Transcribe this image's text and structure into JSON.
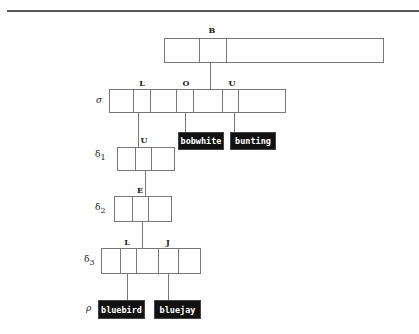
{
  "diagram": {
    "type": "trie",
    "root": {
      "edge_label": "B"
    },
    "rows": {
      "sigma": {
        "label": "σ",
        "edge_labels": [
          "L",
          "O",
          "U"
        ]
      },
      "delta1": {
        "label": "δ",
        "sub": "1",
        "edge_labels": [
          "U"
        ]
      },
      "delta2": {
        "label": "δ",
        "sub": "2",
        "edge_labels": [
          "E"
        ]
      },
      "delta3": {
        "label": "δ",
        "sub": "3",
        "edge_labels": [
          "L",
          "J"
        ]
      },
      "rho": {
        "label": "ρ"
      }
    },
    "leaves": [
      "bobwhite",
      "bunting",
      "bluebird",
      "bluejay"
    ]
  }
}
